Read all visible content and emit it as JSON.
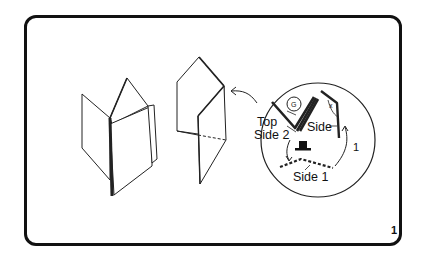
{
  "figure": {
    "page_number": "1",
    "inset": {
      "labels": {
        "top": "Top",
        "side2": "Side 2",
        "side": "Side",
        "side1": "Side 1",
        "step": "1",
        "angle_mark": "x"
      },
      "icons": [
        "coin-icon",
        "top-hat-icon"
      ]
    },
    "models": [
      "folded-book-model",
      "valley-fold-model"
    ],
    "colors": {
      "line": "#111111",
      "background": "#ffffff"
    }
  }
}
